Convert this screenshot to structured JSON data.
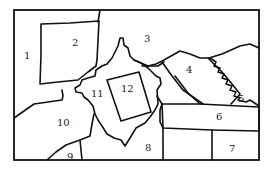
{
  "diagram": {
    "type": "region-map",
    "regions": [
      {
        "id": 1,
        "label": "1",
        "x": 9,
        "y": 60
      },
      {
        "id": 2,
        "label": "2",
        "x": 72,
        "y": 46
      },
      {
        "id": 3,
        "label": "3",
        "x": 144,
        "y": 42
      },
      {
        "id": 4,
        "label": "4",
        "x": 186,
        "y": 73
      },
      {
        "id": 5,
        "label": "5",
        "x": 238,
        "y": 102
      },
      {
        "id": 6,
        "label": "6",
        "x": 216,
        "y": 120
      },
      {
        "id": 7,
        "label": "7",
        "x": 229,
        "y": 152
      },
      {
        "id": 8,
        "label": "8",
        "x": 145,
        "y": 151
      },
      {
        "id": 9,
        "label": "9",
        "x": 67,
        "y": 160
      },
      {
        "id": 10,
        "label": "10",
        "x": 57,
        "y": 126
      },
      {
        "id": 11,
        "label": "11",
        "x": 92,
        "y": 97
      },
      {
        "id": 12,
        "label": "12",
        "x": 121,
        "y": 92
      }
    ]
  }
}
